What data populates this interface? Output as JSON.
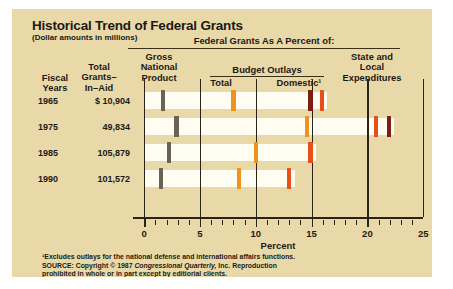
{
  "card": {
    "title": "Historical Trend of Federal Grants",
    "subtitle": "(Dollar amounts in millions)",
    "banner": "Federal Grants As A Percent of:",
    "group_header": "Budget Outlays",
    "columns": {
      "fiscal_years": "Fiscal\nYears",
      "fiscal_years_l1": "Fiscal",
      "fiscal_years_l2": "Years",
      "total_grants_l1": "Total",
      "total_grants_l2": "Grants–",
      "total_grants_l3": "In–Aid",
      "gnp_l1": "Gross",
      "gnp_l2": "National",
      "gnp_l3": "Product",
      "total_outlays": "Total",
      "domestic": "Domestic¹",
      "state_local_l1": "State and",
      "state_local_l2": "Local",
      "state_local_l3": "Expenditures"
    },
    "axis_label": "Percent",
    "footnote": "¹Excludes outlays for the national defense and international affairs functions.",
    "source_line1_a": "SOURCE: Copyright © 1987 ",
    "source_line1_b": "Congressional Quarterly,",
    "source_line1_c": " Inc. Reproduction",
    "source_line2": "prohibited in whole or in part except by editiorial clients."
  },
  "colors": {
    "background": "#ead9a8",
    "band": "#fffdf2",
    "gnp": "#6b6257",
    "total_outlays": "#f0921e",
    "domestic": "#7a1f12",
    "state_local": "#e8501b",
    "rule": "#2a2418",
    "text": "#1c1a16"
  },
  "chart_data": {
    "type": "bar",
    "title": "Historical Trend of Federal Grants",
    "subtitle": "(Dollar amounts in millions)",
    "xlabel": "Percent",
    "ylabel": "Fiscal Years",
    "xlim": [
      0,
      26.5
    ],
    "grid": true,
    "legend_position": "column-headers",
    "xticks": [
      0,
      5,
      10,
      15,
      20,
      25
    ],
    "xtick_labels": [
      "0",
      "5",
      "10",
      "15",
      "20",
      "25"
    ],
    "minor_tick_step": 1,
    "gridlines": [
      0,
      5,
      10,
      15,
      20,
      25
    ],
    "categories": [
      "1965",
      "1975",
      "1985",
      "1990"
    ],
    "grants_in_aid": [
      "$ 10,904",
      "49,834",
      "105,879",
      "101,572"
    ],
    "series": [
      {
        "name": "Gross National Product",
        "color": "#6b6257",
        "values": [
          1.7,
          2.9,
          2.2,
          1.5
        ]
      },
      {
        "name": "Budget Outlays – Total",
        "color": "#f0921e",
        "values": [
          8.0,
          14.6,
          10.0,
          8.5
        ]
      },
      {
        "name": "Budget Outlays – Domestic¹",
        "color": "#7a1f12",
        "values": [
          14.9,
          21.9,
          null,
          null
        ]
      },
      {
        "name": "State and Local Expenditures",
        "color": "#e8501b",
        "values": [
          15.9,
          20.8,
          14.9,
          13.0
        ]
      }
    ],
    "rows": [
      {
        "year": "1965",
        "grants_in_aid": "$ 10,904",
        "gnp": 1.7,
        "outlays_total": 8.0,
        "outlays_domestic": 14.9,
        "state_local": 15.9,
        "band_end": 16.4
      },
      {
        "year": "1975",
        "grants_in_aid": "49,834",
        "gnp": 2.9,
        "outlays_total": 14.6,
        "outlays_domestic": 21.9,
        "state_local": 20.8,
        "band_end": 22.4
      },
      {
        "year": "1985",
        "grants_in_aid": "105,879",
        "gnp": 2.2,
        "outlays_total": 10.0,
        "outlays_domestic": null,
        "state_local": 14.9,
        "band_end": 15.4
      },
      {
        "year": "1990",
        "grants_in_aid": "101,572",
        "gnp": 1.5,
        "outlays_total": 8.5,
        "outlays_domestic": null,
        "state_local": 13.0,
        "band_end": 13.5
      }
    ]
  }
}
